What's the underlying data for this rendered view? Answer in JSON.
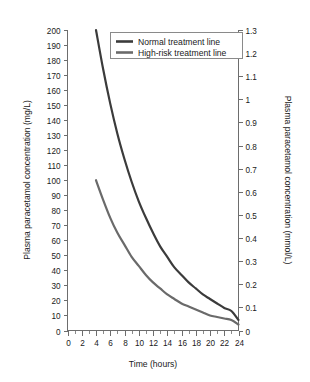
{
  "chart_data": {
    "type": "line",
    "title": "",
    "xlabel": "Time (hours)",
    "ylabel": "Plasma paracetamol concentration (mg/L)",
    "ylabel_right": "Plasma paracetamol concentration (mmol/L)",
    "xlim": [
      0,
      24
    ],
    "ylim": [
      0,
      200
    ],
    "ylim_right": [
      0,
      1.3
    ],
    "grid": false,
    "legend_position": "top-center",
    "x_tick_labels": [
      "0",
      "2",
      "4",
      "6",
      "8",
      "10",
      "12",
      "14",
      "16",
      "18",
      "20",
      "22",
      "24"
    ],
    "x_tick_values": [
      0,
      2,
      4,
      6,
      8,
      10,
      12,
      14,
      16,
      18,
      20,
      22,
      24
    ],
    "x_minor_tick_values": [
      1,
      3,
      5,
      7,
      9,
      11,
      13,
      15,
      17,
      19,
      21,
      23
    ],
    "y_tick_labels": [
      "0",
      "10",
      "20",
      "30",
      "40",
      "50",
      "60",
      "70",
      "80",
      "90",
      "100",
      "110",
      "120",
      "130",
      "140",
      "150",
      "160",
      "170",
      "180",
      "190",
      "200"
    ],
    "y_tick_values": [
      0,
      10,
      20,
      30,
      40,
      50,
      60,
      70,
      80,
      90,
      100,
      110,
      120,
      130,
      140,
      150,
      160,
      170,
      180,
      190,
      200
    ],
    "y_right_tick_labels": [
      "0",
      "0.1",
      "0.2",
      "0.3",
      "0.4",
      "0.5",
      "0.6",
      "0.7",
      "0.8",
      "0.9",
      "1",
      "1.1",
      "1.2",
      "1.3"
    ],
    "y_right_tick_values": [
      0,
      0.1,
      0.2,
      0.3,
      0.4,
      0.5,
      0.6,
      0.7,
      0.8,
      0.9,
      1.0,
      1.1,
      1.2,
      1.3
    ],
    "series": [
      {
        "name": "Normal treatment line",
        "color": "#3b3b3b",
        "x": [
          4,
          5,
          6,
          7,
          8,
          9,
          10,
          11,
          12,
          13,
          14,
          15,
          16,
          17,
          18,
          19,
          20,
          21,
          22,
          23,
          24
        ],
        "values": [
          200,
          174,
          151,
          131,
          114,
          99,
          86,
          75,
          65,
          56,
          49,
          42,
          37,
          32,
          28,
          24,
          21,
          18,
          15,
          13,
          7
        ]
      },
      {
        "name": "High-risk treatment line",
        "color": "#6a6a6a",
        "x": [
          4,
          5,
          6,
          7,
          8,
          9,
          10,
          11,
          12,
          13,
          14,
          15,
          16,
          17,
          18,
          19,
          20,
          21,
          22,
          23,
          24
        ],
        "values": [
          100,
          87,
          75,
          65,
          57,
          49,
          43,
          37,
          32,
          28,
          24,
          21,
          18,
          16,
          14,
          12,
          10,
          9,
          8,
          7,
          4
        ]
      }
    ],
    "legend": [
      {
        "label": "Normal treatment line",
        "color": "#3b3b3b"
      },
      {
        "label": "High-risk treatment line",
        "color": "#6a6a6a"
      }
    ]
  },
  "colors": {
    "normal_line": "#3b3b3b",
    "high_risk_line": "#6a6a6a",
    "axis": "#6d6d6d",
    "text": "#1a1a1a",
    "background": "#ffffff"
  }
}
